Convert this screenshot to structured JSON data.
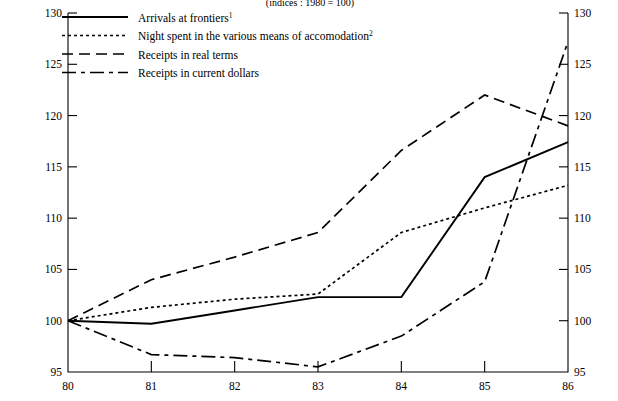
{
  "chart_data": {
    "type": "line",
    "title": "(indices : 1980 = 100)",
    "xlabel": "",
    "ylabel": "",
    "x": [
      80,
      81,
      82,
      83,
      84,
      85,
      86
    ],
    "categories": [
      "80",
      "81",
      "82",
      "83",
      "84",
      "85",
      "86"
    ],
    "xlim": [
      80,
      86
    ],
    "ylim": [
      95,
      130
    ],
    "y_ticks": [
      95,
      100,
      105,
      110,
      115,
      120,
      125,
      130
    ],
    "x_ticks": [
      "80",
      "81",
      "82",
      "83",
      "84",
      "85",
      "86"
    ],
    "grid": false,
    "legend_position": "top-left",
    "dual_y_axis": true,
    "series": [
      {
        "name": "Arrivals at frontiers",
        "footnote": "1",
        "style": "solid",
        "values": [
          100.0,
          99.7,
          101.0,
          102.3,
          102.3,
          114.0,
          117.4
        ]
      },
      {
        "name": "Night spent in the various means of accomodation",
        "footnote": "2",
        "style": "dotted",
        "values": [
          100.0,
          101.3,
          102.1,
          102.6,
          108.6,
          111.0,
          113.2
        ]
      },
      {
        "name": "Receipts in real terms",
        "footnote": "",
        "style": "dashed",
        "values": [
          100.0,
          104.0,
          106.2,
          108.6,
          116.6,
          122.0,
          119.0
        ]
      },
      {
        "name": "Receipts in current dollars",
        "footnote": "",
        "style": "dash-dot",
        "values": [
          100.0,
          96.7,
          96.4,
          95.5,
          98.5,
          103.8,
          127.2
        ]
      }
    ]
  }
}
